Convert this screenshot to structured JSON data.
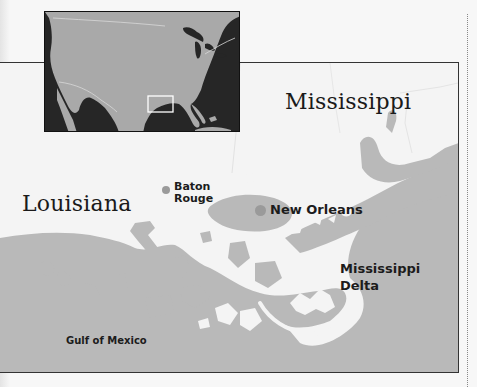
{
  "inset_map": {
    "region": "United States",
    "highlight_box": "Louisiana coast / Mississippi Delta area"
  },
  "main_map": {
    "states": [
      {
        "name": "Mississippi"
      },
      {
        "name": "Louisiana"
      }
    ],
    "cities": [
      {
        "name_line1": "Baton",
        "name_line2": "Rouge"
      },
      {
        "name": "New Orleans"
      }
    ],
    "features": [
      {
        "name_line1": "Mississippi",
        "name_line2": "Delta"
      },
      {
        "name": "Gulf of Mexico"
      }
    ]
  },
  "colors": {
    "land": "#f4f4f4",
    "water": "#b8b8b8",
    "inset_ocean": "#262626",
    "inset_land": "#a8a8a8",
    "city_dot": "#9a9a9a",
    "frame": "#333333"
  }
}
